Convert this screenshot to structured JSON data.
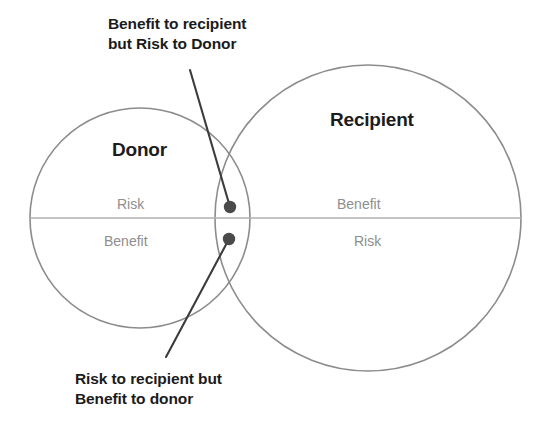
{
  "diagram": {
    "kind": "venn-two-circle",
    "background_color": "#ffffff",
    "circle_stroke_color": "#8c8c8c",
    "divider_color": "#b0b0b0",
    "dot_color": "#4a4a4a",
    "leader_line_color": "#3c3c3c",
    "title_text_color": "#1c1c1c",
    "quadrant_text_color": "#8e8e8e"
  },
  "circles": {
    "donor": {
      "title": "Donor",
      "top_quadrant_label": "Risk",
      "bottom_quadrant_label": "Benefit"
    },
    "recipient": {
      "title": "Recipient",
      "top_quadrant_label": "Benefit",
      "bottom_quadrant_label": "Risk"
    }
  },
  "callouts": {
    "top": {
      "line1": "Benefit to recipient",
      "line2": "but Risk to Donor",
      "marker": "intersection-dot-upper"
    },
    "bottom": {
      "line1": "Risk to recipient but",
      "line2": "Benefit to donor",
      "marker": "intersection-dot-lower"
    }
  }
}
